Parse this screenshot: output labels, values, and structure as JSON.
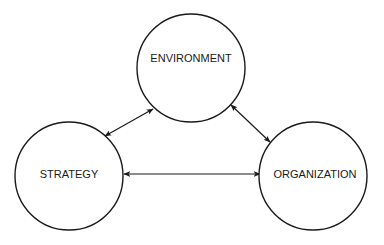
{
  "diagram": {
    "type": "triad-relationship",
    "nodes": [
      {
        "id": "environment",
        "label": "ENVIRONMENT"
      },
      {
        "id": "strategy",
        "label": "STRATEGY"
      },
      {
        "id": "organization",
        "label": "ORGANIZATION"
      }
    ],
    "edges": [
      {
        "from": "environment",
        "to": "strategy",
        "direction": "bidirectional"
      },
      {
        "from": "environment",
        "to": "organization",
        "direction": "bidirectional"
      },
      {
        "from": "strategy",
        "to": "organization",
        "direction": "bidirectional"
      }
    ],
    "colors": {
      "stroke": "#1a1a1a",
      "fill": "#ffffff",
      "background": "#ffffff"
    }
  }
}
